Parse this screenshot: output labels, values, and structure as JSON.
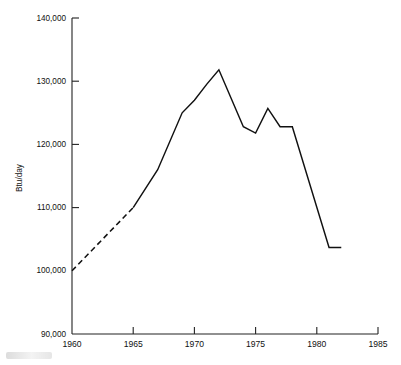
{
  "chart_data": {
    "type": "line",
    "title": "",
    "subtitle": "",
    "xlabel": "",
    "ylabel": "Btu/day",
    "xlim": [
      1960,
      1985
    ],
    "ylim": [
      90000,
      140000
    ],
    "grid": false,
    "legend": "none",
    "x_ticks": [
      1960,
      1965,
      1970,
      1975,
      1980,
      1985
    ],
    "x_tick_labels": [
      "1960",
      "1965",
      "1970",
      "1975",
      "1980",
      "1985"
    ],
    "y_ticks": [
      90000,
      100000,
      110000,
      120000,
      130000,
      140000
    ],
    "y_tick_labels": [
      "90,000",
      "100,000",
      "110,000",
      "120,000",
      "130,000",
      "140,000"
    ],
    "series": [
      {
        "name": "Btu/day (estimated)",
        "style": "dashed",
        "x": [
          1960,
          1965
        ],
        "values": [
          100000,
          110000
        ]
      },
      {
        "name": "Btu/day (measured)",
        "style": "solid",
        "x": [
          1965,
          1967,
          1969,
          1970,
          1971,
          1972,
          1974,
          1975,
          1976,
          1977,
          1978,
          1981,
          1982
        ],
        "values": [
          110000,
          116000,
          125000,
          127000,
          129500,
          131800,
          122800,
          121800,
          125700,
          122800,
          122800,
          103700,
          103700
        ]
      }
    ],
    "annotations": []
  },
  "axis": {
    "y_axis_title": "Btu/day"
  }
}
